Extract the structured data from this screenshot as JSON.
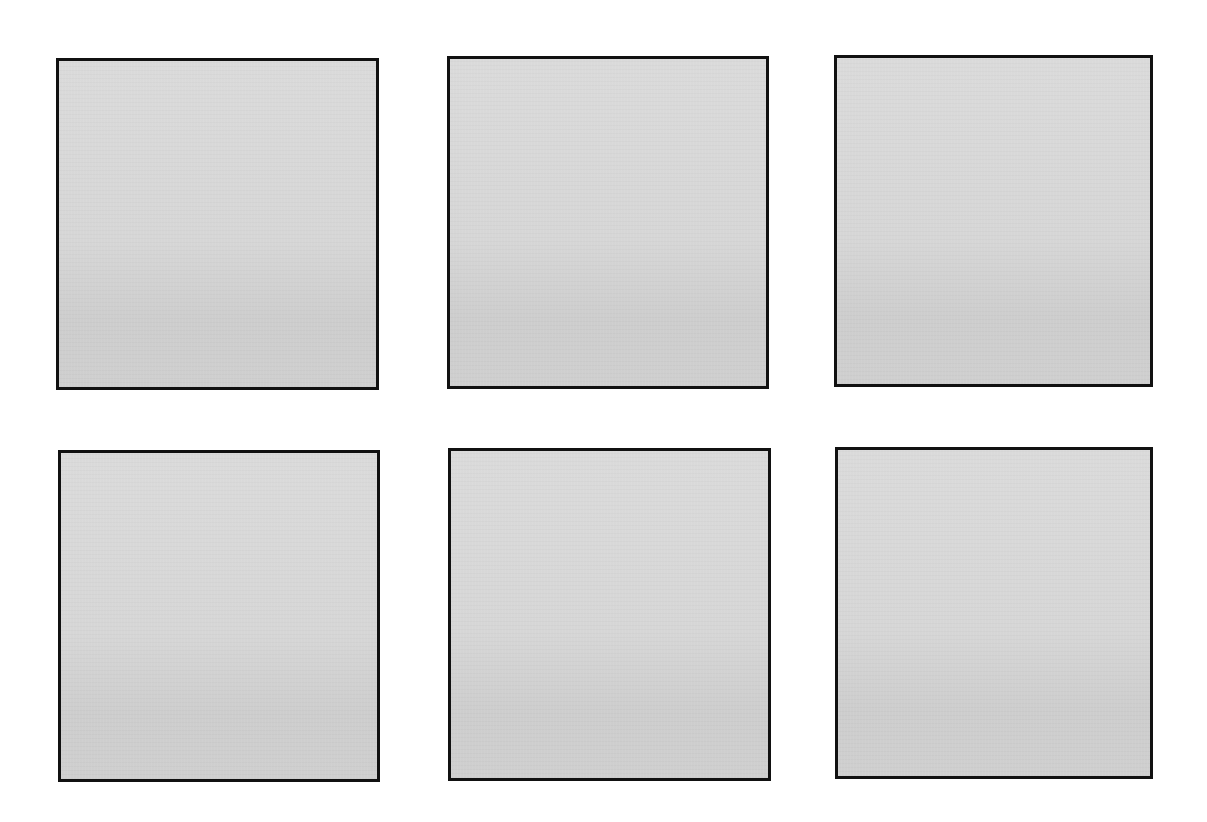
{
  "page": {
    "background": "#ffffff",
    "layout": "grid-2x3"
  },
  "panels": [
    {
      "id": "panel-1",
      "row": 1,
      "col": 1,
      "x": 56,
      "y": 58,
      "w": 323,
      "h": 332,
      "fill": "#d6d6d6",
      "border": "#111111"
    },
    {
      "id": "panel-2",
      "row": 1,
      "col": 2,
      "x": 447,
      "y": 56,
      "w": 322,
      "h": 333,
      "fill": "#d6d6d6",
      "border": "#111111"
    },
    {
      "id": "panel-3",
      "row": 1,
      "col": 3,
      "x": 834,
      "y": 55,
      "w": 319,
      "h": 332,
      "fill": "#d6d6d6",
      "border": "#111111"
    },
    {
      "id": "panel-4",
      "row": 2,
      "col": 1,
      "x": 58,
      "y": 450,
      "w": 322,
      "h": 332,
      "fill": "#d6d6d6",
      "border": "#111111"
    },
    {
      "id": "panel-5",
      "row": 2,
      "col": 2,
      "x": 448,
      "y": 448,
      "w": 323,
      "h": 333,
      "fill": "#d6d6d6",
      "border": "#111111"
    },
    {
      "id": "panel-6",
      "row": 2,
      "col": 3,
      "x": 835,
      "y": 447,
      "w": 318,
      "h": 332,
      "fill": "#d6d6d6",
      "border": "#111111"
    }
  ]
}
